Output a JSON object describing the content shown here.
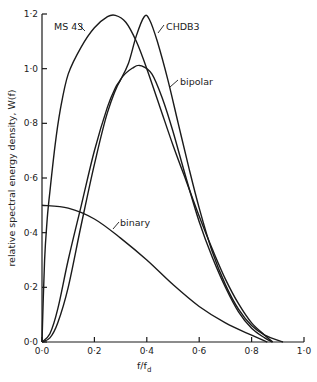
{
  "chart_data": {
    "type": "line",
    "title": "",
    "xlabel": "f/f_d",
    "ylabel": "relative spectral energy density, W(f)",
    "xlim": [
      0.0,
      1.0
    ],
    "ylim": [
      0.0,
      1.2
    ],
    "grid": false,
    "legend": "inline labels",
    "x_ticks": [
      "0·0",
      "0·2",
      "0·4",
      "0·6",
      "0·8",
      "1·0"
    ],
    "y_ticks": [
      "0·0",
      "0·2",
      "0·4",
      "0·6",
      "0·8",
      "1·0",
      "1·2"
    ],
    "series": [
      {
        "name": "MS43",
        "points": [
          [
            0,
            0
          ],
          [
            0.01,
            0.3
          ],
          [
            0.02,
            0.45
          ],
          [
            0.03,
            0.55
          ],
          [
            0.05,
            0.72
          ],
          [
            0.07,
            0.85
          ],
          [
            0.1,
            0.98
          ],
          [
            0.15,
            1.08
          ],
          [
            0.2,
            1.15
          ],
          [
            0.25,
            1.19
          ],
          [
            0.28,
            1.195
          ],
          [
            0.32,
            1.17
          ],
          [
            0.36,
            1.1
          ],
          [
            0.4,
            1.0
          ],
          [
            0.45,
            0.86
          ],
          [
            0.5,
            0.72
          ],
          [
            0.55,
            0.59
          ],
          [
            0.6,
            0.46
          ],
          [
            0.65,
            0.34
          ],
          [
            0.7,
            0.23
          ],
          [
            0.75,
            0.14
          ],
          [
            0.8,
            0.07
          ],
          [
            0.85,
            0.025
          ],
          [
            0.88,
            0
          ]
        ]
      },
      {
        "name": "CHDB3",
        "points": [
          [
            0,
            0
          ],
          [
            0.03,
            0.03
          ],
          [
            0.06,
            0.12
          ],
          [
            0.1,
            0.3
          ],
          [
            0.15,
            0.5
          ],
          [
            0.2,
            0.7
          ],
          [
            0.25,
            0.86
          ],
          [
            0.28,
            0.93
          ],
          [
            0.3,
            0.96
          ],
          [
            0.33,
            1.02
          ],
          [
            0.36,
            1.12
          ],
          [
            0.39,
            1.19
          ],
          [
            0.41,
            1.18
          ],
          [
            0.44,
            1.1
          ],
          [
            0.48,
            0.96
          ],
          [
            0.52,
            0.8
          ],
          [
            0.56,
            0.64
          ],
          [
            0.6,
            0.49
          ],
          [
            0.65,
            0.33
          ],
          [
            0.7,
            0.21
          ],
          [
            0.75,
            0.12
          ],
          [
            0.8,
            0.06
          ],
          [
            0.85,
            0.025
          ],
          [
            0.92,
            0
          ]
        ]
      },
      {
        "name": "bipolar",
        "points": [
          [
            0,
            0
          ],
          [
            0.03,
            0.015
          ],
          [
            0.06,
            0.07
          ],
          [
            0.1,
            0.2
          ],
          [
            0.15,
            0.43
          ],
          [
            0.2,
            0.65
          ],
          [
            0.25,
            0.84
          ],
          [
            0.3,
            0.96
          ],
          [
            0.35,
            1.005
          ],
          [
            0.38,
            1.01
          ],
          [
            0.42,
            0.98
          ],
          [
            0.46,
            0.89
          ],
          [
            0.5,
            0.77
          ],
          [
            0.55,
            0.6
          ],
          [
            0.6,
            0.44
          ],
          [
            0.65,
            0.31
          ],
          [
            0.7,
            0.2
          ],
          [
            0.75,
            0.11
          ],
          [
            0.8,
            0.05
          ],
          [
            0.85,
            0.015
          ],
          [
            0.88,
            0
          ]
        ]
      },
      {
        "name": "binary",
        "points": [
          [
            0,
            0.5
          ],
          [
            0.1,
            0.49
          ],
          [
            0.2,
            0.45
          ],
          [
            0.3,
            0.38
          ],
          [
            0.4,
            0.3
          ],
          [
            0.5,
            0.21
          ],
          [
            0.6,
            0.13
          ],
          [
            0.7,
            0.07
          ],
          [
            0.8,
            0.025
          ],
          [
            0.86,
            0
          ]
        ]
      }
    ],
    "annotations": [
      {
        "text": "MS43",
        "at": [
          0.03,
          1.14
        ],
        "leader_to": [
          0.1,
          1.1
        ]
      },
      {
        "text": "CHDB3",
        "at": [
          0.48,
          1.14
        ],
        "leader_to": [
          0.44,
          1.1
        ]
      },
      {
        "text": "bipolar",
        "at": [
          0.58,
          0.9
        ],
        "leader_to": [
          0.51,
          0.84
        ]
      },
      {
        "text": "binary",
        "at": [
          0.3,
          0.45
        ],
        "leader_to": [
          0.25,
          0.41
        ]
      }
    ]
  },
  "labels": {
    "ylabel": "relative spectral energy density, W(f)",
    "xlabel_main": "f/f",
    "xlabel_sub": "d",
    "series": {
      "ms43": "MS 43",
      "chdb3": "CHDB3",
      "bipolar": "bipolar",
      "binary": "binary"
    },
    "x_ticks": [
      "0·0",
      "0·2",
      "0·4",
      "0·6",
      "0·8",
      "1·0"
    ],
    "y_ticks": [
      "0·0",
      "0·2",
      "0·4",
      "0·6",
      "0·8",
      "1·0",
      "1·2"
    ]
  }
}
